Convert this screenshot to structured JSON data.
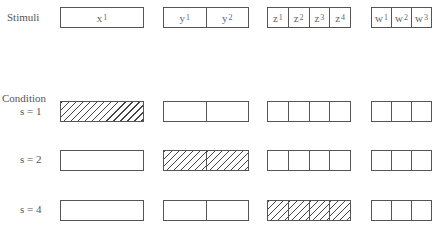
{
  "header": {
    "stimuli_label": "Stimuli",
    "condition_label": "Condition"
  },
  "stimuli": {
    "x": [
      {
        "base": "x",
        "sub": "1"
      }
    ],
    "y": [
      {
        "base": "y",
        "sub": "1"
      },
      {
        "base": "y",
        "sub": "2"
      }
    ],
    "z": [
      {
        "base": "z",
        "sub": "1"
      },
      {
        "base": "z",
        "sub": "2"
      },
      {
        "base": "z",
        "sub": "3"
      },
      {
        "base": "z",
        "sub": "4"
      }
    ],
    "w": [
      {
        "base": "w",
        "sub": "1"
      },
      {
        "base": "w",
        "sub": "2"
      },
      {
        "base": "w",
        "sub": "3"
      }
    ]
  },
  "conditions": [
    {
      "label": "s = 1",
      "hatched_group": "x"
    },
    {
      "label": "s = 2",
      "hatched_group": "y"
    },
    {
      "label": "s = 4",
      "hatched_group": "z"
    }
  ],
  "colors": {
    "line": "#555555",
    "hatch": "#444444",
    "background": "#ffffff"
  }
}
